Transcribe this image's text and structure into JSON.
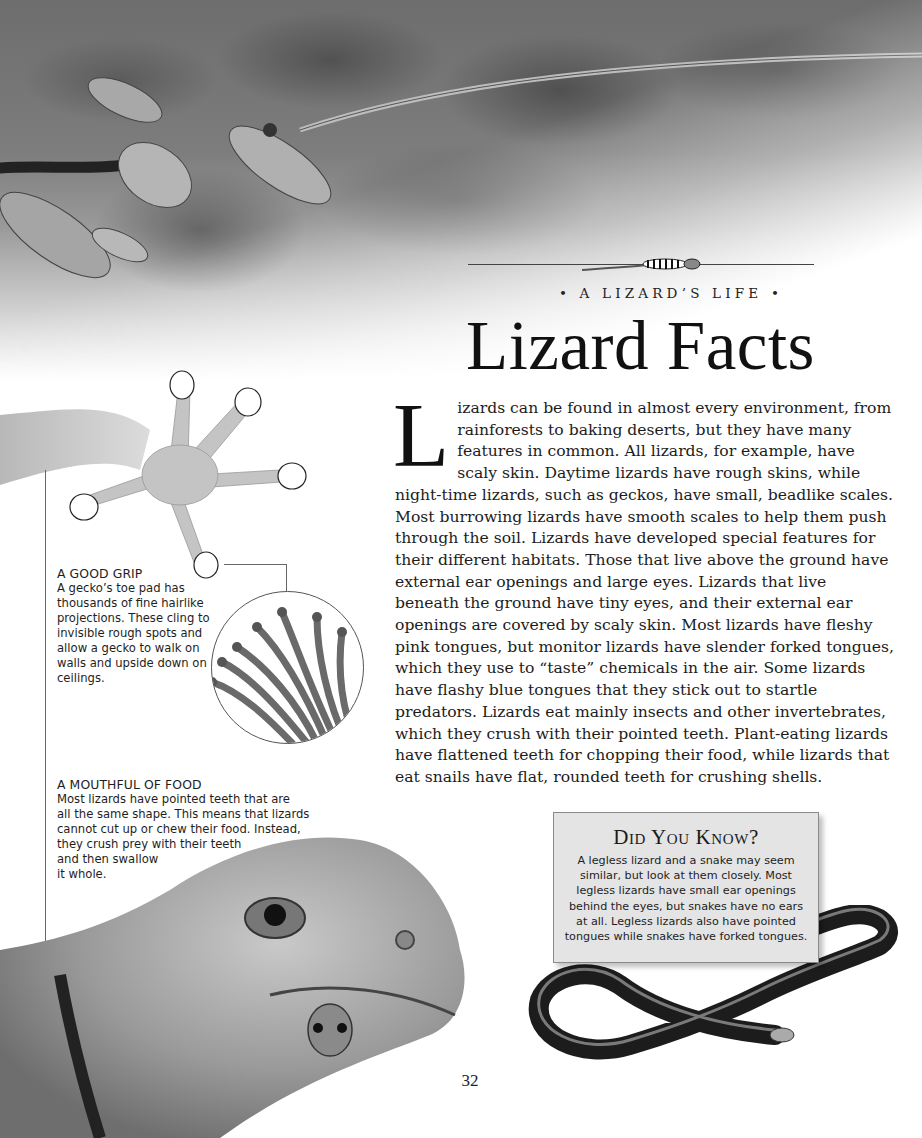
{
  "header": {
    "kicker": "• A LIZARD’S LIFE •",
    "title": "Lizard Facts"
  },
  "body": {
    "drop_cap": "L",
    "text": "izards can be found in almost every environment, from rainforests to baking deserts, but they have many features in common. All lizards, for example, have scaly skin. Daytime lizards have rough skins, while night-time lizards, such as geckos, have small, beadlike scales. Most burrowing lizards have smooth scales to help them push through the soil. Lizards have developed special features for their different habitats. Those that live above the ground have external ear openings and large eyes. Lizards that live beneath the ground have tiny eyes, and their external ear openings are covered by scaly skin. Most lizards have fleshy pink tongues, but monitor lizards have slender forked tongues, which they use to “taste” chemicals in the air. Some lizards have flashy blue tongues that they stick out to startle predators. Lizards eat mainly insects and other invertebrates, which they crush with their pointed teeth. Plant-eating lizards have flattened teeth for chopping their food, while lizards that eat snails have flat, rounded teeth for crushing shells."
  },
  "captions": {
    "good_grip": {
      "heading": "A GOOD GRIP",
      "text": "A gecko’s toe pad has thousands of fine hairlike projections. These cling to invisible rough spots and allow a gecko to walk on walls and upside down on ceilings."
    },
    "mouthful": {
      "heading": "A MOUTHFUL OF FOOD",
      "lines": [
        "Most lizards have pointed teeth that are",
        "all the same shape. This means that lizards",
        "cannot cut up or chew their food. Instead,",
        "they crush prey with their teeth",
        "and then swallow",
        "it whole."
      ]
    }
  },
  "did_you_know": {
    "title": "Did You Know?",
    "lines": [
      "A legless lizard and a snake may seem",
      "similar, but look at them closely. Most",
      "legless lizards have small ear openings",
      "behind the eyes, but snakes have no ears",
      "at all. Legless lizards also have pointed",
      "tongues while snakes have forked tongues."
    ]
  },
  "page_number": "32",
  "illustrations": {
    "foliage": "rainforest-foliage-illustration",
    "gecko_foot": "gecko-foot-illustration",
    "toe_pad": "toe-pad-magnified-illustration",
    "lizard_head": "collared-lizard-photo",
    "legless_lizard": "legless-lizard-photo",
    "header_lizard": "small-striped-lizard-illustration"
  }
}
